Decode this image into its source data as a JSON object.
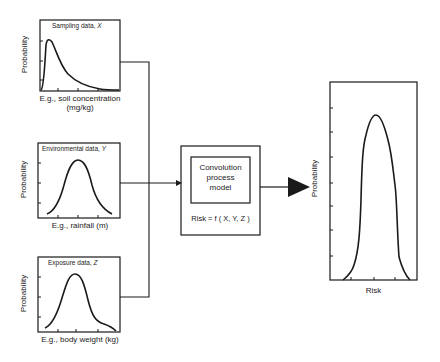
{
  "diagram": {
    "inputs": [
      {
        "title_prefix": "Sampling data, ",
        "title_var": "X",
        "y_label": "Probability",
        "x_label_line1": "E.g., soil concentration",
        "x_label_line2": "(mg/kg)",
        "shape": "right-skewed"
      },
      {
        "title_prefix": "Environmental data, ",
        "title_var": "Y",
        "y_label": "Probability",
        "x_label_line1": "E.g., rainfall (m)",
        "shape": "bell"
      },
      {
        "title_prefix": "Exposure data, ",
        "title_var": "Z",
        "y_label": "Probability",
        "x_label_line1": "E.g., body weight (kg)",
        "shape": "bell"
      }
    ],
    "process": {
      "inner_line1": "Convolution",
      "inner_line2": "process",
      "inner_line3": "model",
      "formula": "Risk = f ( X, Y, Z )"
    },
    "output": {
      "y_label": "Probability",
      "x_label": "Risk",
      "shape": "narrow-peaked"
    },
    "colors": {
      "line": "#1a1a1a",
      "background": "#ffffff"
    }
  }
}
